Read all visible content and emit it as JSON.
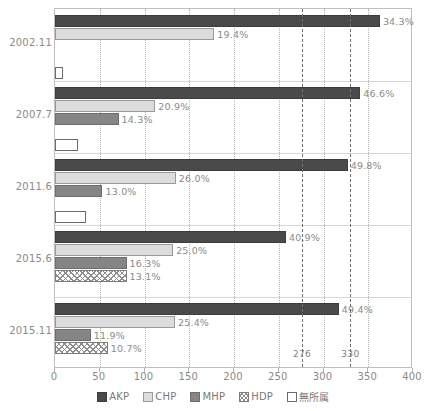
{
  "chart_data": {
    "type": "bar",
    "orientation": "horizontal",
    "title": "",
    "xlabel": "",
    "ylabel": "",
    "xlim": [
      0,
      400
    ],
    "xticks": [
      0,
      50,
      100,
      150,
      200,
      250,
      300,
      350,
      400
    ],
    "grid": true,
    "legend_position": "bottom",
    "categories": [
      "2002.11",
      "2007.7",
      "2011.6",
      "2015.6",
      "2015.11"
    ],
    "series": [
      {
        "name": "AKP",
        "color": "#4a4a4a",
        "values": [
          363,
          341,
          327,
          258,
          317
        ],
        "labels": [
          "34.3%",
          "46.6%",
          "49.8%",
          "40.9%",
          "49.4%"
        ]
      },
      {
        "name": "CHP",
        "color": "#dcdcdc",
        "values": [
          178,
          112,
          135,
          132,
          134
        ],
        "labels": [
          "19.4%",
          "20.9%",
          "26.0%",
          "25.0%",
          "25.4%"
        ]
      },
      {
        "name": "MHP",
        "color": "#858585",
        "values": [
          0,
          71,
          53,
          80,
          40
        ],
        "labels": [
          "",
          "14.3%",
          "13.0%",
          "16.3%",
          "11.9%"
        ]
      },
      {
        "name": "HDP",
        "color": "#8d8d8d",
        "values": [
          0,
          0,
          0,
          80,
          59
        ],
        "labels": [
          "",
          "",
          "",
          "13.1%",
          "10.7%"
        ]
      },
      {
        "name": "無所属",
        "color": "#ffffff",
        "values": [
          9,
          26,
          35,
          0,
          0
        ],
        "labels": [
          "",
          "",
          "",
          "",
          ""
        ]
      }
    ],
    "threshold_lines": [
      {
        "value": 276,
        "label": "276"
      },
      {
        "value": 330,
        "label": "330"
      }
    ]
  },
  "legend": {
    "items": [
      {
        "key": "akp",
        "label": "AKP"
      },
      {
        "key": "chp",
        "label": "CHP"
      },
      {
        "key": "mhp",
        "label": "MHP"
      },
      {
        "key": "hdp",
        "label": "HDP"
      },
      {
        "key": "ind",
        "label": "無所属"
      }
    ]
  }
}
